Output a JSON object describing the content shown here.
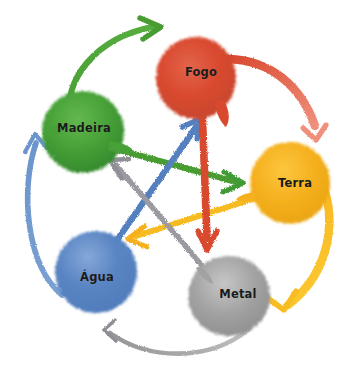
{
  "diagram": {
    "style": "watercolor",
    "background_color": "#ffffff",
    "width": 360,
    "height": 379,
    "label_color": "#1a1a1a"
  },
  "nodes": [
    {
      "id": "fogo",
      "label": "Fogo",
      "color": "#d9492f",
      "color_light": "#e8705a",
      "cx": 196,
      "cy": 78,
      "rx": 40,
      "ry": 41,
      "label_x": 201,
      "label_y": 72
    },
    {
      "id": "madeira",
      "label": "Madeira",
      "color": "#3f9b35",
      "color_light": "#62b851",
      "cx": 83,
      "cy": 132,
      "rx": 41,
      "ry": 41,
      "label_x": 84,
      "label_y": 128
    },
    {
      "id": "terra",
      "label": "Terra",
      "color": "#f5b01e",
      "color_light": "#fbc94a",
      "cx": 290,
      "cy": 183,
      "rx": 40,
      "ry": 41,
      "label_x": 295,
      "label_y": 183
    },
    {
      "id": "agua",
      "label": "Água",
      "color": "#5480c0",
      "color_light": "#7fa3d4",
      "cx": 96,
      "cy": 272,
      "rx": 41,
      "ry": 41,
      "label_x": 97,
      "label_y": 277
    },
    {
      "id": "metal",
      "label": "Metal",
      "color": "#9b9b9b",
      "color_light": "#c2c2c2",
      "cx": 229,
      "cy": 296,
      "rx": 41,
      "ry": 40,
      "label_x": 238,
      "label_y": 294
    }
  ],
  "generating_cycle": {
    "name": "ciclo de geracao",
    "arrows": [
      {
        "id": "madeira-fogo",
        "from": "madeira",
        "to": "fogo",
        "color": "#4a9c33"
      },
      {
        "id": "fogo-terra",
        "from": "fogo",
        "to": "terra",
        "color": "#e06a52"
      },
      {
        "id": "terra-metal",
        "from": "terra",
        "to": "metal",
        "color": "#f7bb20"
      },
      {
        "id": "metal-agua",
        "from": "metal",
        "to": "agua",
        "color": "#9b9b9b"
      },
      {
        "id": "agua-madeira",
        "from": "agua",
        "to": "madeira",
        "color": "#6b95cc"
      }
    ]
  },
  "overcoming_cycle": {
    "name": "ciclo de controle",
    "arrows": [
      {
        "id": "madeira-terra",
        "from": "madeira",
        "to": "terra",
        "color": "#4a9c33"
      },
      {
        "id": "terra-agua",
        "from": "terra",
        "to": "agua",
        "color": "#f7bb20"
      },
      {
        "id": "agua-fogo",
        "from": "agua",
        "to": "fogo",
        "color": "#5480c0"
      },
      {
        "id": "fogo-metal",
        "from": "fogo",
        "to": "metal",
        "color": "#d9492f"
      },
      {
        "id": "metal-madeira",
        "from": "metal",
        "to": "madeira",
        "color": "#8e8e95"
      }
    ]
  }
}
